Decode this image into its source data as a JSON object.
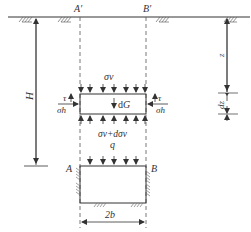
{
  "diagram": {
    "type": "soil-arching free-body diagram",
    "labels": {
      "a_prime": "A′",
      "b_prime": "B′",
      "a": "A",
      "b": "B",
      "depth_total": "H",
      "depth_z": "z",
      "thickness": "dz",
      "sigma_v_top": "σv",
      "sigma_v_bottom": "σv+dσv",
      "weight": "dG",
      "tau_left": "τ",
      "tau_right": "τ",
      "sigma_h_left": "σh",
      "sigma_h_right": "σh",
      "surcharge": "q",
      "width": "2b"
    },
    "colors": {
      "line": "#333333",
      "dashed": "#555555",
      "background": "#ffffff"
    }
  }
}
